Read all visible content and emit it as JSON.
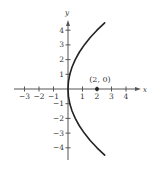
{
  "chart_data": {
    "type": "line",
    "title": "",
    "xlabel": "x",
    "ylabel": "y",
    "xlim": [
      -3.5,
      5
    ],
    "ylim": [
      -4.8,
      5
    ],
    "x_ticks": [
      -3,
      -2,
      -1,
      1,
      2,
      3,
      4
    ],
    "y_ticks": [
      -4,
      -3,
      -2,
      -1,
      1,
      2,
      3,
      4
    ],
    "x_tick_labels": [
      "−3",
      "−2",
      "−1",
      "1",
      "2",
      "3",
      "4"
    ],
    "y_tick_labels": [
      "−4",
      "−3",
      "−2",
      "−1",
      "1",
      "2",
      "3",
      "4"
    ],
    "grid": false,
    "legend": null,
    "series": [
      {
        "name": "parabola x = y²/8",
        "equation": "y^2 = 8x",
        "color": "#222222",
        "points": [
          [
            2.53,
            -4.5
          ],
          [
            2.0,
            -4.0
          ],
          [
            1.53,
            -3.5
          ],
          [
            1.125,
            -3.0
          ],
          [
            0.78,
            -2.5
          ],
          [
            0.5,
            -2.0
          ],
          [
            0.28,
            -1.5
          ],
          [
            0.125,
            -1.0
          ],
          [
            0.03,
            -0.5
          ],
          [
            0.0,
            0.0
          ],
          [
            0.03,
            0.5
          ],
          [
            0.125,
            1.0
          ],
          [
            0.28,
            1.5
          ],
          [
            0.5,
            2.0
          ],
          [
            0.78,
            2.5
          ],
          [
            1.125,
            3.0
          ],
          [
            1.53,
            3.5
          ],
          [
            2.0,
            4.0
          ],
          [
            2.53,
            4.5
          ]
        ]
      }
    ],
    "annotations": [
      {
        "type": "point",
        "x": 2,
        "y": 0,
        "label": "(2, 0)",
        "color": "#222222"
      }
    ]
  },
  "layout": {
    "origin_px": [
      68,
      89
    ],
    "x_unit_px": 14.5,
    "y_unit_px": 14.7,
    "x_axis_px": [
      14,
      141
    ],
    "y_axis_px": [
      20,
      160
    ],
    "axis_color": "#555555",
    "curve_color": "#222222"
  }
}
